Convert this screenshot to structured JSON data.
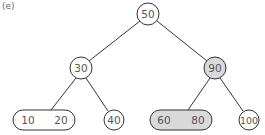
{
  "figure": {
    "label": "(e)"
  },
  "tree": {
    "root": {
      "value": "50",
      "highlighted": false
    },
    "left": {
      "value": "30",
      "highlighted": false
    },
    "right": {
      "value": "90",
      "highlighted": true
    },
    "left_left": {
      "values": [
        "10",
        "20"
      ],
      "highlighted": false
    },
    "left_right": {
      "value": "40",
      "highlighted": false
    },
    "right_left": {
      "values": [
        "60",
        "80"
      ],
      "highlighted": true
    },
    "right_right": {
      "value": "100",
      "highlighted": false
    }
  },
  "colors": {
    "stroke": "#333333",
    "highlight_fill": "#d9d9d9",
    "node_fill": "#ffffff",
    "text": "#555555"
  }
}
